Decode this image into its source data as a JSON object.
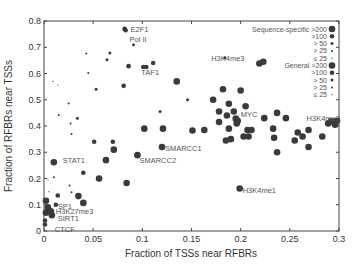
{
  "chart_data": {
    "type": "scatter",
    "title": "",
    "xlabel": "Fraction of TSSs near RFBRs",
    "ylabel": "Fraction of RFBRs near TSSs",
    "xlim": [
      0,
      0.3
    ],
    "ylim": [
      0,
      0.8
    ],
    "xticks": [
      0,
      0.05,
      0.1,
      0.15,
      0.2,
      0.25,
      0.3
    ],
    "xtick_labels": [
      "0",
      "0.05",
      "0.1",
      "0.15",
      "0.2",
      "0.25",
      "0.3"
    ],
    "yticks": [
      0,
      0.1,
      0.2,
      0.3,
      0.4,
      0.5,
      0.6,
      0.7,
      0.8
    ],
    "ytick_labels": [
      "0",
      "0.1",
      "0.2",
      "0.3",
      "0.4",
      "0.5",
      "0.6",
      "0.7",
      "0.8"
    ],
    "grid": false,
    "legend": {
      "placement": "top-right",
      "groups": [
        {
          "name": "Sequence-specific",
          "entries": [
            ">200",
            ">100",
            "> 50",
            "> 25",
            "≤ 25"
          ]
        },
        {
          "name": "General",
          "entries": [
            ">200",
            ">100",
            "> 50",
            "> 25",
            "≤ 25"
          ]
        }
      ]
    },
    "size_classes": [
      ">200",
      ">100",
      "> 50",
      "> 25",
      "≤ 25"
    ],
    "points": [
      {
        "x": 0.082,
        "y": 0.77,
        "size": ">100",
        "label": "E2F1"
      },
      {
        "x": 0.083,
        "y": 0.765,
        "size": ">100"
      },
      {
        "x": 0.091,
        "y": 0.71,
        "size": "> 50",
        "label": "Pol II"
      },
      {
        "x": 0.101,
        "y": 0.625,
        "size": ">100",
        "label": "TAF1"
      },
      {
        "x": 0.104,
        "y": 0.625,
        "size": ">100"
      },
      {
        "x": 0.111,
        "y": 0.64,
        "size": ">100"
      },
      {
        "x": 0.086,
        "y": 0.628,
        "size": ">100"
      },
      {
        "x": 0.081,
        "y": 0.553,
        "size": ">100"
      },
      {
        "x": 0.067,
        "y": 0.678,
        "size": "> 50"
      },
      {
        "x": 0.064,
        "y": 0.652,
        "size": "> 50"
      },
      {
        "x": 0.053,
        "y": 0.54,
        "size": "> 50"
      },
      {
        "x": 0.043,
        "y": 0.676,
        "size": "> 25"
      },
      {
        "x": 0.045,
        "y": 0.602,
        "size": "> 25"
      },
      {
        "x": 0.135,
        "y": 0.57,
        "size": ">200"
      },
      {
        "x": 0.009,
        "y": 0.57,
        "size": "≤ 25"
      },
      {
        "x": 0.014,
        "y": 0.556,
        "size": "≤ 25"
      },
      {
        "x": 0.025,
        "y": 0.486,
        "size": "> 25"
      },
      {
        "x": 0.015,
        "y": 0.442,
        "size": "> 25"
      },
      {
        "x": 0.034,
        "y": 0.43,
        "size": "> 50"
      },
      {
        "x": 0.027,
        "y": 0.41,
        "size": "> 25"
      },
      {
        "x": 0.028,
        "y": 0.37,
        "size": "> 25"
      },
      {
        "x": 0.102,
        "y": 0.39,
        "size": ">200"
      },
      {
        "x": 0.01,
        "y": 0.262,
        "size": ">200",
        "label": "STAT1"
      },
      {
        "x": 0.01,
        "y": 0.205,
        "size": "> 25"
      },
      {
        "x": 0.014,
        "y": 0.135,
        "size": ">100"
      },
      {
        "x": 0.004,
        "y": 0.195,
        "size": "≤ 25"
      },
      {
        "x": 0.005,
        "y": 0.15,
        "size": "≤ 25"
      },
      {
        "x": 0.002,
        "y": 0.115,
        "size": ">200"
      },
      {
        "x": 0.012,
        "y": 0.1,
        "size": ">100",
        "label": "SP1"
      },
      {
        "x": 0.004,
        "y": 0.09,
        "size": ">200",
        "label": "H3K27me3"
      },
      {
        "x": 0.007,
        "y": 0.075,
        "size": ">200"
      },
      {
        "x": 0.008,
        "y": 0.06,
        "size": ">200",
        "label": "SIRT1"
      },
      {
        "x": 0.002,
        "y": 0.07,
        "size": ">200"
      },
      {
        "x": 0.001,
        "y": 0.04,
        "size": ">100"
      },
      {
        "x": 0.001,
        "y": 0.025,
        "size": ">100",
        "label": "CTCF"
      },
      {
        "x": 0.026,
        "y": 0.173,
        "size": "> 25"
      },
      {
        "x": 0.028,
        "y": 0.148,
        "size": "> 25"
      },
      {
        "x": 0.035,
        "y": 0.133,
        "size": ">200"
      },
      {
        "x": 0.04,
        "y": 0.107,
        "size": ">200"
      },
      {
        "x": 0.04,
        "y": 0.222,
        "size": ">100"
      },
      {
        "x": 0.056,
        "y": 0.2,
        "size": ">200"
      },
      {
        "x": 0.051,
        "y": 0.34,
        "size": ">100"
      },
      {
        "x": 0.063,
        "y": 0.27,
        "size": ">200"
      },
      {
        "x": 0.07,
        "y": 0.34,
        "size": ">100"
      },
      {
        "x": 0.071,
        "y": 0.31,
        "size": ">200"
      },
      {
        "x": 0.084,
        "y": 0.183,
        "size": ">200"
      },
      {
        "x": 0.095,
        "y": 0.289,
        "size": ">200",
        "label": "SMARCC2"
      },
      {
        "x": 0.12,
        "y": 0.32,
        "size": ">200",
        "label": "SMARCC1"
      },
      {
        "x": 0.121,
        "y": 0.39,
        "size": ">200"
      },
      {
        "x": 0.151,
        "y": 0.383,
        "size": ">200"
      },
      {
        "x": 0.118,
        "y": 0.455,
        "size": "> 50"
      },
      {
        "x": 0.184,
        "y": 0.66,
        "size": "> 50"
      },
      {
        "x": 0.219,
        "y": 0.638,
        "size": ">200",
        "label": "H3K4me3"
      },
      {
        "x": 0.223,
        "y": 0.645,
        "size": ">200"
      },
      {
        "x": 0.146,
        "y": 0.5,
        "size": "> 50"
      },
      {
        "x": 0.182,
        "y": 0.54,
        "size": ">200"
      },
      {
        "x": 0.2,
        "y": 0.535,
        "size": ">200"
      },
      {
        "x": 0.172,
        "y": 0.5,
        "size": ">200"
      },
      {
        "x": 0.188,
        "y": 0.485,
        "size": ">200"
      },
      {
        "x": 0.205,
        "y": 0.475,
        "size": ">200"
      },
      {
        "x": 0.193,
        "y": 0.455,
        "size": ">200"
      },
      {
        "x": 0.178,
        "y": 0.455,
        "size": ">200"
      },
      {
        "x": 0.186,
        "y": 0.44,
        "size": ">200"
      },
      {
        "x": 0.195,
        "y": 0.428,
        "size": ">200",
        "label": "MYC"
      },
      {
        "x": 0.197,
        "y": 0.42,
        "size": ">200"
      },
      {
        "x": 0.178,
        "y": 0.415,
        "size": ">200"
      },
      {
        "x": 0.224,
        "y": 0.43,
        "size": ">200"
      },
      {
        "x": 0.237,
        "y": 0.45,
        "size": ">200"
      },
      {
        "x": 0.163,
        "y": 0.385,
        "size": ">200"
      },
      {
        "x": 0.188,
        "y": 0.39,
        "size": ">200"
      },
      {
        "x": 0.196,
        "y": 0.41,
        "size": ">200"
      },
      {
        "x": 0.207,
        "y": 0.385,
        "size": ">200"
      },
      {
        "x": 0.211,
        "y": 0.385,
        "size": ">200"
      },
      {
        "x": 0.233,
        "y": 0.39,
        "size": ">200"
      },
      {
        "x": 0.185,
        "y": 0.345,
        "size": ">200"
      },
      {
        "x": 0.19,
        "y": 0.35,
        "size": ">200"
      },
      {
        "x": 0.203,
        "y": 0.36,
        "size": ">200"
      },
      {
        "x": 0.208,
        "y": 0.36,
        "size": ">200"
      },
      {
        "x": 0.234,
        "y": 0.355,
        "size": ">200"
      },
      {
        "x": 0.246,
        "y": 0.43,
        "size": ">200"
      },
      {
        "x": 0.258,
        "y": 0.375,
        "size": ">200"
      },
      {
        "x": 0.263,
        "y": 0.36,
        "size": ">200"
      },
      {
        "x": 0.269,
        "y": 0.385,
        "size": ">200"
      },
      {
        "x": 0.283,
        "y": 0.36,
        "size": ">200"
      },
      {
        "x": 0.269,
        "y": 0.32,
        "size": ">200"
      },
      {
        "x": 0.289,
        "y": 0.41,
        "size": ">200"
      },
      {
        "x": 0.292,
        "y": 0.418,
        "size": ">200",
        "label": "H3K4me2"
      },
      {
        "x": 0.296,
        "y": 0.405,
        "size": ">200"
      },
      {
        "x": 0.298,
        "y": 0.42,
        "size": ">200"
      },
      {
        "x": 0.255,
        "y": 0.345,
        "size": ">200"
      },
      {
        "x": 0.237,
        "y": 0.3,
        "size": ">200"
      },
      {
        "x": 0.199,
        "y": 0.162,
        "size": ">200",
        "label": "H3K4me1"
      }
    ],
    "annotations": [
      {
        "text": "E2F1",
        "x": 0.088,
        "y": 0.77
      },
      {
        "text": "Pol II",
        "x": 0.087,
        "y": 0.73
      },
      {
        "text": "TAF1",
        "x": 0.099,
        "y": 0.605
      },
      {
        "text": "H3K4me3",
        "x": 0.17,
        "y": 0.66
      },
      {
        "text": "MYC",
        "x": 0.2,
        "y": 0.445
      },
      {
        "text": "H3K4me2",
        "x": 0.267,
        "y": 0.43
      },
      {
        "text": "SMARCC1",
        "x": 0.123,
        "y": 0.317
      },
      {
        "text": "SMARCC2",
        "x": 0.097,
        "y": 0.27
      },
      {
        "text": "STAT1",
        "x": 0.019,
        "y": 0.27
      },
      {
        "text": "SP1",
        "x": 0.014,
        "y": 0.096
      },
      {
        "text": "H3K27me3",
        "x": 0.012,
        "y": 0.076
      },
      {
        "text": "SIRT1",
        "x": 0.014,
        "y": 0.048
      },
      {
        "text": "CTCF",
        "x": 0.011,
        "y": 0.006
      },
      {
        "text": "H3K4me1",
        "x": 0.202,
        "y": 0.158
      }
    ]
  }
}
